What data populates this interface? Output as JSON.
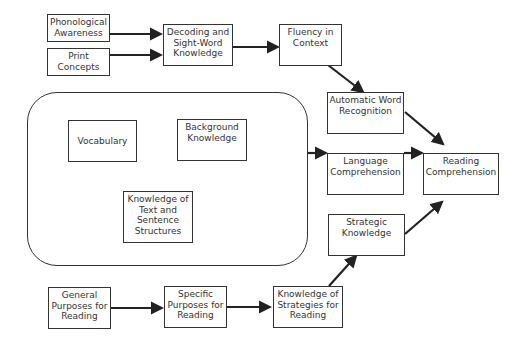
{
  "diagram": {
    "title": "",
    "nodes": {
      "phonological": "Phonological Awareness",
      "print": "Print Concepts",
      "decoding": "Decoding and Sight-Word Knowledge",
      "fluency": "Fluency in Context",
      "automatic": "Automatic Word Recognition",
      "vocabulary": "Vocabulary",
      "background": "Background Knowledge",
      "text_structures": "Knowledge of Text and Sentence Structures",
      "language": "Language Comprehension",
      "reading": "Reading Comprehension",
      "strategic": "Strategic Knowledge",
      "general": "General Purposes for Reading",
      "specific": "Specific Purposes for Reading",
      "strategies": "Knowledge of Strategies for Reading"
    },
    "edges": [
      [
        "phonological",
        "decoding"
      ],
      [
        "print",
        "decoding"
      ],
      [
        "decoding",
        "fluency"
      ],
      [
        "fluency",
        "automatic"
      ],
      [
        "automatic",
        "reading"
      ],
      [
        "language_group",
        "language"
      ],
      [
        "language",
        "reading"
      ],
      [
        "strategic",
        "reading"
      ],
      [
        "general",
        "specific"
      ],
      [
        "specific",
        "strategies"
      ],
      [
        "strategies",
        "strategic"
      ]
    ],
    "colors": {
      "stroke": "#333333",
      "background": "#ffffff"
    }
  }
}
